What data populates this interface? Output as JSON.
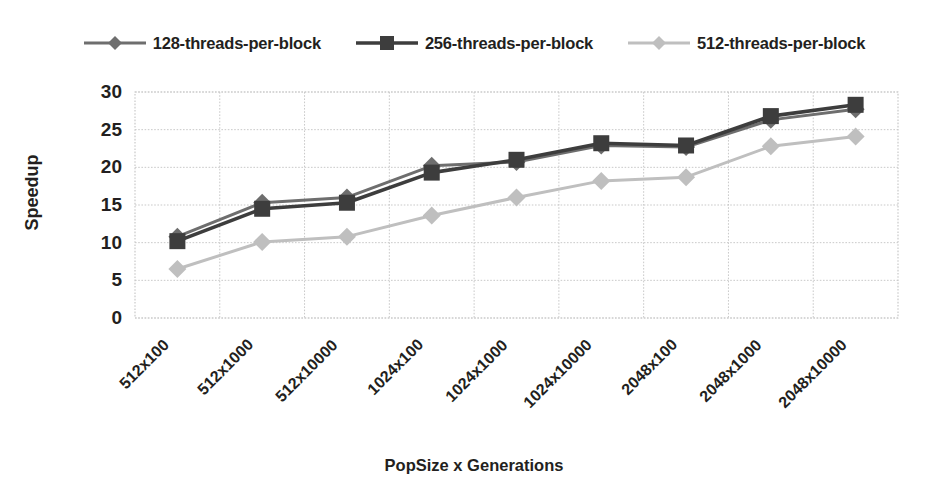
{
  "chart_data": {
    "type": "line",
    "title": "",
    "xlabel": "PopSize x Generations",
    "ylabel": "Speedup",
    "ylim": [
      0,
      30
    ],
    "yticks": [
      "0",
      "5",
      "10",
      "15",
      "20",
      "25",
      "30"
    ],
    "grid": true,
    "legend_position": "top",
    "categories": [
      "512x100",
      "512x1000",
      "512x10000",
      "1024x100",
      "1024x1000",
      "1024x10000",
      "2048x100",
      "2048x1000",
      "2048x10000"
    ],
    "series": [
      {
        "name": "128-threads-per-block",
        "color": "#6e6e6e",
        "marker": "diamond",
        "values": [
          10.8,
          15.3,
          16.0,
          20.2,
          20.7,
          22.9,
          22.7,
          26.3,
          27.7
        ]
      },
      {
        "name": "256-threads-per-block",
        "color": "#3d3d3d",
        "marker": "square",
        "values": [
          10.2,
          14.5,
          15.3,
          19.3,
          21.0,
          23.2,
          22.9,
          26.8,
          28.3
        ]
      },
      {
        "name": "512-threads-per-block",
        "color": "#bfbfbf",
        "marker": "diamond",
        "values": [
          6.5,
          10.1,
          10.8,
          13.6,
          16.0,
          18.2,
          18.7,
          22.8,
          24.1
        ]
      }
    ]
  },
  "legend": {
    "items": [
      {
        "label": "128-threads-per-block"
      },
      {
        "label": "256-threads-per-block"
      },
      {
        "label": "512-threads-per-block"
      }
    ]
  },
  "axes": {
    "y_title": "Speedup",
    "x_title": "PopSize x Generations"
  },
  "colors": {
    "series_128": "#6e6e6e",
    "series_256": "#3d3d3d",
    "series_512": "#bfbfbf",
    "gridline": "#c9c9c9",
    "text": "#231f20",
    "background": "#ffffff"
  }
}
